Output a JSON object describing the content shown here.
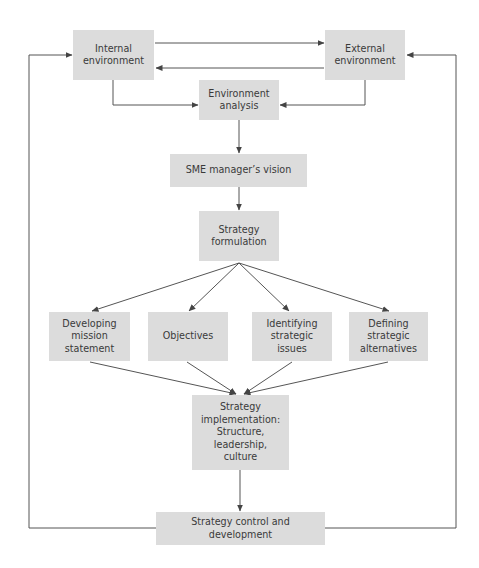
{
  "diagram": {
    "colors": {
      "box_fill": "#dcdcdc",
      "text": "#3a3a3a",
      "line": "#555555"
    },
    "nodes": {
      "internal_env": {
        "label": "Internal\nenvironment"
      },
      "external_env": {
        "label": "External\nenvironment"
      },
      "env_analysis": {
        "label": "Environment\nanalysis"
      },
      "sme_vision": {
        "label": "SME manager’s vision"
      },
      "strategy_formulation": {
        "label": "Strategy\nformulation"
      },
      "mission_statement": {
        "label": "Developing\nmission\nstatement"
      },
      "objectives": {
        "label": "Objectives"
      },
      "strategic_issues": {
        "label": "Identifying\nstrategic\nissues"
      },
      "strategic_alternatives": {
        "label": "Defining\nstrategic\nalternatives"
      },
      "strategy_implementation": {
        "label": "Strategy\nimplementation:\nStructure,\nleadership,\nculture"
      },
      "strategy_control": {
        "label": "Strategy control and development"
      }
    },
    "edges": [
      {
        "from": "internal_env",
        "to": "external_env"
      },
      {
        "from": "external_env",
        "to": "internal_env"
      },
      {
        "from": "internal_env",
        "to": "env_analysis"
      },
      {
        "from": "external_env",
        "to": "env_analysis"
      },
      {
        "from": "env_analysis",
        "to": "sme_vision"
      },
      {
        "from": "sme_vision",
        "to": "strategy_formulation"
      },
      {
        "from": "strategy_formulation",
        "to": "mission_statement"
      },
      {
        "from": "strategy_formulation",
        "to": "objectives"
      },
      {
        "from": "strategy_formulation",
        "to": "strategic_issues"
      },
      {
        "from": "strategy_formulation",
        "to": "strategic_alternatives"
      },
      {
        "from": "mission_statement",
        "to": "strategy_implementation"
      },
      {
        "from": "objectives",
        "to": "strategy_implementation"
      },
      {
        "from": "strategic_issues",
        "to": "strategy_implementation"
      },
      {
        "from": "strategic_alternatives",
        "to": "strategy_implementation"
      },
      {
        "from": "strategy_implementation",
        "to": "strategy_control"
      },
      {
        "from": "strategy_control",
        "to": "internal_env"
      },
      {
        "from": "strategy_control",
        "to": "external_env"
      }
    ]
  }
}
